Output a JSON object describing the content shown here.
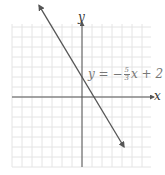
{
  "chart_data": {
    "type": "line",
    "title": "",
    "equation": "y = -5/3 x + 2",
    "xlabel": "x",
    "ylabel": "y",
    "xlim": [
      -7,
      7
    ],
    "ylim": [
      -7,
      7
    ],
    "grid": true,
    "grid_step": 1,
    "series": [
      {
        "name": "y = -5/3x + 2",
        "slope": -1.6667,
        "intercept": 2,
        "x": [
          -4.2,
          8.4
        ],
        "y": [
          9,
          -12
        ],
        "color": "#555555",
        "arrows": "both"
      }
    ],
    "annotations": [
      {
        "text": "y = -5/3 x + 2",
        "x": 2,
        "y": 2
      }
    ],
    "legend": "none"
  },
  "labels": {
    "x_axis": "x",
    "y_axis": "y",
    "eq_lhs": "y = −",
    "eq_num": "5",
    "eq_den": "3",
    "eq_rhs": "x + 2"
  },
  "colors": {
    "grid": "#e4e4e4",
    "axis": "#555555",
    "line": "#555555",
    "text": "#777777"
  }
}
